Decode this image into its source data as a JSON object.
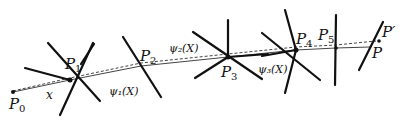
{
  "diagram": {
    "colors": {
      "stroke": "#111111",
      "background": "#ffffff"
    },
    "points": [
      {
        "id": "P0",
        "label": "P",
        "sub": "0",
        "x": 13,
        "y": 92,
        "lx": 9,
        "ly": 109
      },
      {
        "id": "P1",
        "label": "P",
        "sub": "1",
        "x": 70,
        "y": 80,
        "lx": 65,
        "ly": 69
      },
      {
        "id": "P2",
        "label": "P",
        "sub": "2",
        "x": 141,
        "y": 66,
        "lx": 141,
        "ly": 61
      },
      {
        "id": "P3",
        "label": "P",
        "sub": "3",
        "x": 228,
        "y": 57,
        "lx": 221,
        "ly": 77
      },
      {
        "id": "P4",
        "label": "P",
        "sub": "4",
        "x": 296,
        "y": 50,
        "lx": 296,
        "ly": 44
      },
      {
        "id": "P5",
        "label": "P",
        "sub": "5",
        "x": 336,
        "y": 48,
        "lx": 320,
        "ly": 40
      },
      {
        "id": "P",
        "label": "P",
        "sub": "",
        "x": 370,
        "y": 47,
        "lx": 372,
        "ly": 58
      },
      {
        "id": "Pprime",
        "label": "P′",
        "sub": "",
        "x": 378,
        "y": 40,
        "lx": 382,
        "ly": 37
      }
    ],
    "function_labels": [
      {
        "text": "x",
        "x": 46,
        "y": 99
      },
      {
        "text": "ψ₁(X)",
        "x": 109,
        "y": 95
      },
      {
        "text": "ψ₂(X)",
        "x": 169,
        "y": 52
      },
      {
        "text": "ψ₃(X)",
        "x": 258,
        "y": 73
      }
    ],
    "title": ""
  }
}
